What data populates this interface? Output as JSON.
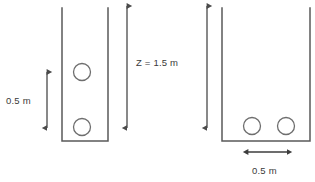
{
  "figure": {
    "type": "engineering-schematic",
    "background_color": "#ffffff",
    "stroke_color": "#595959",
    "circle_stroke_color": "#6e6e6e",
    "text_color": "#3a3a3a"
  },
  "labels": {
    "height_dimension": "Z = 1.5 m",
    "left_spacing_dimension": "0.5 m",
    "bottom_spacing_dimension": "0.5 m"
  },
  "left_container": {
    "name": "vertical-arrangement-container",
    "left_wall_x": 62,
    "right_wall_x": 108,
    "top_y": 8,
    "bottom_y": 141,
    "circles": [
      {
        "cx": 82,
        "cy": 72,
        "r": 8.5
      },
      {
        "cx": 82,
        "cy": 127,
        "r": 8.5
      }
    ]
  },
  "right_container": {
    "name": "horizontal-arrangement-container",
    "left_wall_x": 222,
    "right_wall_x": 310,
    "top_y": 8,
    "bottom_y": 141,
    "circles": [
      {
        "cx": 252,
        "cy": 126,
        "r": 8.5
      },
      {
        "cx": 286,
        "cy": 126,
        "r": 8.5
      }
    ]
  },
  "dimensions": {
    "left_vertical_arrow": {
      "x": 47,
      "y_top": 72,
      "y_bottom": 128
    },
    "center_vertical_arrow": {
      "x": 127,
      "y_top": 6,
      "y_bottom": 128
    },
    "right_vertical_arrow": {
      "x": 207,
      "y_top": 6,
      "y_bottom": 128
    },
    "bottom_horizontal_arrow": {
      "y": 152,
      "x_left": 248,
      "x_right": 287
    }
  },
  "label_positions": {
    "left_spacing": {
      "x": 6,
      "y": 104
    },
    "height": {
      "x": 136,
      "y": 66
    },
    "bottom_spacing": {
      "x": 252,
      "y": 174
    }
  }
}
